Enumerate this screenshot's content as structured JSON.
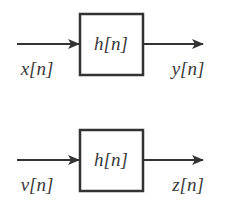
{
  "diagram": {
    "type": "block-diagram",
    "systems": [
      {
        "id": "system-1",
        "block_label": "h[n]",
        "input_label": "x[n]",
        "output_label": "y[n]"
      },
      {
        "id": "system-2",
        "block_label": "h[n]",
        "input_label": "v[n]",
        "output_label": "z[n]"
      }
    ],
    "colors": {
      "stroke": "#333333",
      "text": "#3a3a3a",
      "background": "#ffffff"
    }
  }
}
